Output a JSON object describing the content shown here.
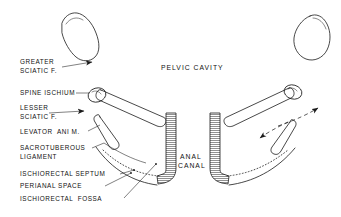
{
  "figure": {
    "center_labels": {
      "pelvic_cavity": "PELVIC CAVITY",
      "anal_canal_line1": "ANAL",
      "anal_canal_line2": "CANAL"
    },
    "left_labels": [
      {
        "id": "greater-sciatic-foramen",
        "line1": "GREATER",
        "line2": "SCIATIC F."
      },
      {
        "id": "spine-of-ischium",
        "line1": "SPINE ISCHIUM",
        "line2": ""
      },
      {
        "id": "lesser-sciatic-foramen",
        "line1": "LESSER",
        "line2": "SCIATIC F."
      },
      {
        "id": "levator-ani-muscle",
        "line1": "LEVATOR  ANI M.",
        "line2": ""
      },
      {
        "id": "sacrotuberous-ligament",
        "line1": "SACROTUBEROUS",
        "line2": "LIGAMENT"
      },
      {
        "id": "ischiorectal-septum",
        "line1": "ISCHIORECTAL SEPTUM",
        "line2": ""
      },
      {
        "id": "perianal-space",
        "line1": "PERIANAL SPACE",
        "line2": ""
      },
      {
        "id": "ischiorectal-fossa",
        "line1": "ISCHIORECTAL  FOSSA",
        "line2": ""
      }
    ],
    "colors": {
      "ink": "#1a1a1a",
      "background": "#ffffff",
      "stipple": "#555555"
    }
  }
}
